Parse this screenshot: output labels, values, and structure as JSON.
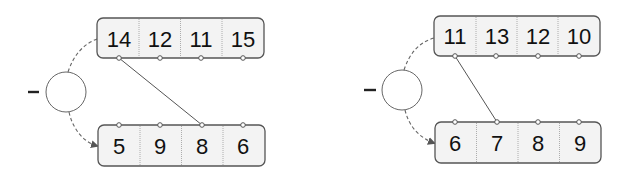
{
  "diagram": {
    "operator_symbol": "−",
    "panels": [
      {
        "id": "left",
        "operator": "−",
        "top_values": [
          "14",
          "12",
          "11",
          "15"
        ],
        "bottom_values": [
          "5",
          "9",
          "8",
          "6"
        ],
        "connector": {
          "from_top_index": 0,
          "to_bottom_index": 2
        }
      },
      {
        "id": "right",
        "operator": "−",
        "top_values": [
          "11",
          "13",
          "12",
          "10"
        ],
        "bottom_values": [
          "6",
          "7",
          "8",
          "9"
        ],
        "connector": {
          "from_top_index": 0,
          "to_bottom_index": 1
        }
      }
    ]
  },
  "colors": {
    "box_fill": "#f3f3f3",
    "box_stroke": "#555555",
    "text": "#111111"
  }
}
